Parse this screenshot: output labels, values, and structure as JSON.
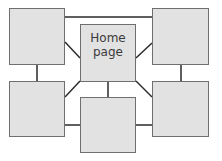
{
  "diagram": {
    "type": "sitemap-hub",
    "colors": {
      "box_fill": "#e2e2e2",
      "box_border": "#6f6f6f",
      "line": "#2a2a2a",
      "text": "#3a3a3a"
    },
    "nodes": [
      {
        "id": "home",
        "label": "Home\npage",
        "x": 80,
        "y": 24,
        "w": 56,
        "h": 58
      },
      {
        "id": "top-left",
        "label": "",
        "x": 9,
        "y": 8,
        "w": 56,
        "h": 57
      },
      {
        "id": "top-right",
        "label": "",
        "x": 152,
        "y": 8,
        "w": 57,
        "h": 57
      },
      {
        "id": "bottom-left",
        "label": "",
        "x": 9,
        "y": 81,
        "w": 56,
        "h": 56
      },
      {
        "id": "bottom-center",
        "label": "",
        "x": 80,
        "y": 97,
        "w": 56,
        "h": 56
      },
      {
        "id": "bottom-right",
        "label": "",
        "x": 152,
        "y": 81,
        "w": 57,
        "h": 56
      }
    ],
    "edges": [
      [
        "top-left",
        "top-right"
      ],
      [
        "top-left",
        "bottom-left"
      ],
      [
        "top-right",
        "bottom-right"
      ],
      [
        "home",
        "top-left"
      ],
      [
        "home",
        "top-right"
      ],
      [
        "home",
        "bottom-left"
      ],
      [
        "home",
        "bottom-right"
      ],
      [
        "home",
        "bottom-center"
      ],
      [
        "bottom-left",
        "bottom-center"
      ],
      [
        "bottom-center",
        "bottom-right"
      ]
    ]
  }
}
